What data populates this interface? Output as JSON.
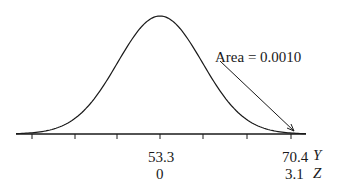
{
  "chart_data": {
    "type": "area",
    "title": "",
    "annotation": "Area = 0.0010",
    "axes": [
      {
        "name": "Y",
        "ticks": [
          {
            "pos": 0,
            "label": "53.3"
          },
          {
            "pos": 3.1,
            "label": "70.4"
          }
        ]
      },
      {
        "name": "Z",
        "ticks": [
          {
            "pos": 0,
            "label": "0"
          },
          {
            "pos": 3.1,
            "label": "3.1"
          }
        ]
      }
    ],
    "mean_y": 53.3,
    "y_value": 70.4,
    "z_value": 3.1,
    "tail_area": 0.001,
    "tick_count": 7,
    "grid": false
  },
  "labels": {
    "annotation": "Area = 0.0010",
    "y_mean": "53.3",
    "y_cut": "70.4",
    "y_axis": "Y",
    "z_mean": "0",
    "z_cut": "3.1",
    "z_axis": "Z"
  }
}
